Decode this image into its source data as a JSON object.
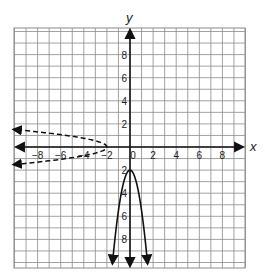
{
  "chart_data": {
    "type": "line",
    "title": "",
    "xlabel": "x",
    "ylabel": "y",
    "xlim": [
      -10,
      10
    ],
    "ylim": [
      -10,
      10
    ],
    "grid": true,
    "x_tick_labels": [
      "-8",
      "-6",
      "-4",
      "-2",
      "0",
      "2",
      "4",
      "6",
      "8"
    ],
    "y_tick_labels": [
      "8",
      "6",
      "4",
      "2",
      "-2",
      "-4",
      "-6",
      "-8"
    ],
    "x_tick_display": [
      "−8",
      "−6",
      "−4",
      "−2",
      "0",
      "2",
      "4",
      "6",
      "8"
    ],
    "y_tick_display": [
      "8",
      "6",
      "4",
      "2",
      "2",
      "4",
      "6",
      "8"
    ],
    "series": [
      {
        "name": "solid parabola (opens down)",
        "style": "solid",
        "description": "vertex (0, -2), opens downward, arrows at bottom",
        "vertex": [
          0,
          -2
        ],
        "points": [
          [
            -1.5,
            -9.9
          ],
          [
            -1,
            -5.5
          ],
          [
            -0.5,
            -2.9
          ],
          [
            0,
            -2
          ],
          [
            0.5,
            -2.9
          ],
          [
            1,
            -5.5
          ],
          [
            1.5,
            -9.9
          ]
        ]
      },
      {
        "name": "dashed parabola (opens left)",
        "style": "dashed",
        "description": "vertex (-2, 0), opens to the left, arrows at left",
        "vertex": [
          -2,
          0
        ],
        "points": [
          [
            -9.9,
            1.5
          ],
          [
            -5.5,
            1
          ],
          [
            -2.9,
            0.5
          ],
          [
            -2,
            0
          ],
          [
            -2.9,
            -0.5
          ],
          [
            -5.5,
            -1
          ],
          [
            -9.9,
            -1.5
          ]
        ]
      }
    ],
    "colors": {
      "grid": "#8a8a8a",
      "axis": "#111111",
      "curve": "#111111"
    }
  }
}
